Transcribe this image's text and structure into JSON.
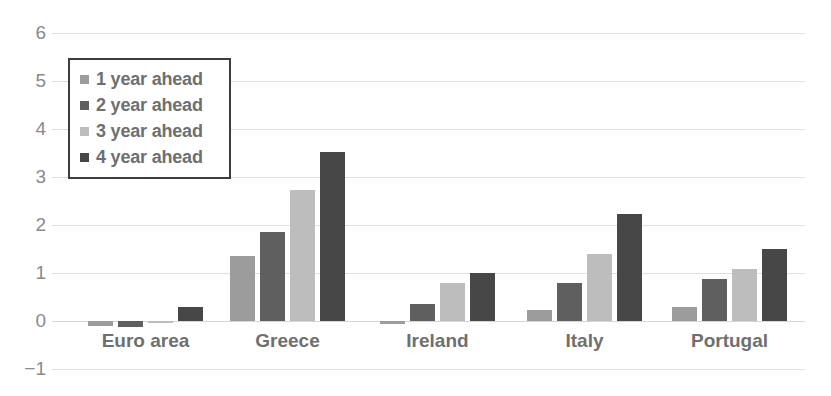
{
  "chart_data": {
    "type": "bar",
    "title": "",
    "subtitle": "",
    "xlabel": "",
    "ylabel": "",
    "categories": [
      "Euro area",
      "Greece",
      "Ireland",
      "Italy",
      "Portugal"
    ],
    "series": [
      {
        "name": "1 year ahead",
        "color": "#9c9c9c",
        "values": [
          -0.11,
          1.35,
          -0.06,
          0.22,
          0.3
        ]
      },
      {
        "name": "2 year ahead",
        "color": "#5f5f5f",
        "values": [
          -0.13,
          1.86,
          0.35,
          0.8,
          0.88
        ]
      },
      {
        "name": "3 year ahead",
        "color": "#bdbdbd",
        "values": [
          -0.05,
          2.73,
          0.8,
          1.4,
          1.09
        ]
      },
      {
        "name": "4 year ahead",
        "color": "#474747",
        "values": [
          0.3,
          3.52,
          1.0,
          2.22,
          1.49
        ]
      }
    ],
    "ylim": [
      -1,
      6
    ],
    "y_ticks": [
      6,
      5,
      4,
      3,
      2,
      1,
      0,
      -1
    ],
    "y_tick_labels": [
      "6",
      "5",
      "4",
      "3",
      "2",
      "1",
      "0",
      "−1"
    ],
    "grid": true,
    "grid_axis": "y",
    "legend_position": "top-left",
    "legend_border": true,
    "axis_label_color": "#8a8a8a",
    "category_label_color": "#6f6f6f",
    "gridline_color": "#d9d9d9",
    "background": "#ffffff"
  }
}
